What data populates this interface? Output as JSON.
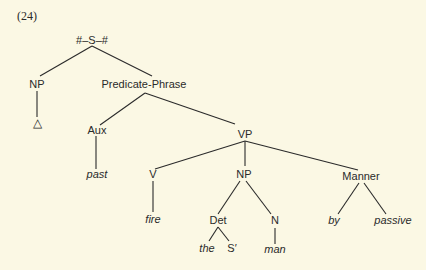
{
  "example_number": "(24)",
  "tree": {
    "root": "#–S–#",
    "nodes": {
      "s": "#–S–#",
      "np1": "NP",
      "delta": "△",
      "pred": "Predicate-Phrase",
      "aux": "Aux",
      "past": "past",
      "vp": "VP",
      "v": "V",
      "fire": "fire",
      "np2": "NP",
      "det": "Det",
      "the": "the",
      "sprime": "S′",
      "n": "N",
      "man": "man",
      "manner": "Manner",
      "by": "by",
      "passive": "passive"
    },
    "edges": [
      [
        "s",
        "np1"
      ],
      [
        "s",
        "pred"
      ],
      [
        "np1",
        "delta"
      ],
      [
        "pred",
        "aux"
      ],
      [
        "pred",
        "vp"
      ],
      [
        "aux",
        "past"
      ],
      [
        "vp",
        "v"
      ],
      [
        "vp",
        "np2"
      ],
      [
        "vp",
        "manner"
      ],
      [
        "v",
        "fire"
      ],
      [
        "np2",
        "det"
      ],
      [
        "np2",
        "n"
      ],
      [
        "det",
        "the"
      ],
      [
        "det",
        "sprime"
      ],
      [
        "n",
        "man"
      ],
      [
        "manner",
        "by"
      ],
      [
        "manner",
        "passive"
      ]
    ]
  },
  "colors": {
    "background": "#fbf8e4",
    "ink": "#2a2a2a"
  }
}
